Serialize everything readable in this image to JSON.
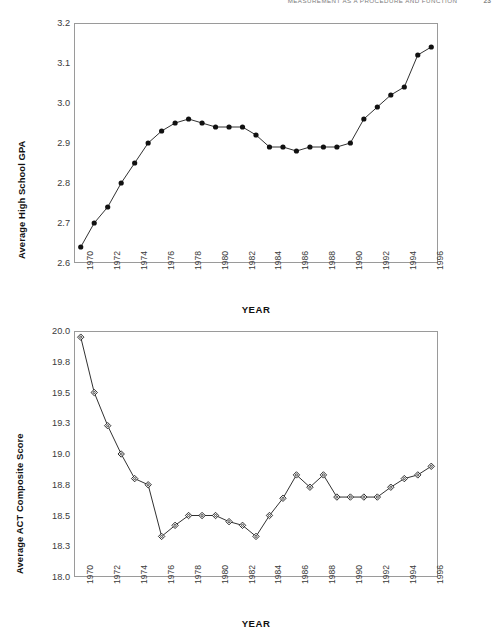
{
  "running_head": {
    "title": "MEASUREMENT AS A PROCEDURE AND FUNCTION",
    "page": "23"
  },
  "figures": [
    {
      "id": "gpa",
      "ylabel": "Average High School GPA",
      "xlabel": "YEAR"
    },
    {
      "id": "act",
      "ylabel": "Average ACT Composite Score",
      "xlabel": "YEAR"
    }
  ],
  "chart_data": [
    {
      "type": "line",
      "title": "",
      "xlabel": "YEAR",
      "ylabel": "Average High School GPA",
      "xlim": [
        1969.5,
        1996.5
      ],
      "ylim": [
        2.6,
        3.2
      ],
      "ytick_labels": [
        "2.6",
        "2.7",
        "2.8",
        "2.9",
        "3.0",
        "3.1",
        "3.2"
      ],
      "ytick_values": [
        2.6,
        2.7,
        2.8,
        2.9,
        3.0,
        3.1,
        3.2
      ],
      "xtick_labels": [
        "1970",
        "1972",
        "1974",
        "1976",
        "1978",
        "1980",
        "1982",
        "1984",
        "1986",
        "1988",
        "1990",
        "1992",
        "1994",
        "1996"
      ],
      "xtick_values": [
        1970,
        1972,
        1974,
        1976,
        1978,
        1980,
        1982,
        1984,
        1986,
        1988,
        1990,
        1992,
        1994,
        1996
      ],
      "grid": false,
      "legend": "none",
      "marker": "filled-circle",
      "x": [
        1970,
        1971,
        1972,
        1973,
        1974,
        1975,
        1976,
        1977,
        1978,
        1979,
        1980,
        1981,
        1982,
        1983,
        1984,
        1985,
        1986,
        1987,
        1988,
        1989,
        1990,
        1991,
        1992,
        1993,
        1994,
        1995,
        1996
      ],
      "values": [
        2.64,
        2.7,
        2.74,
        2.8,
        2.85,
        2.9,
        2.93,
        2.95,
        2.96,
        2.95,
        2.94,
        2.94,
        2.94,
        2.92,
        2.89,
        2.89,
        2.88,
        2.89,
        2.89,
        2.89,
        2.9,
        2.96,
        2.99,
        3.02,
        3.04,
        3.12,
        3.14
      ]
    },
    {
      "type": "line",
      "title": "",
      "xlabel": "YEAR",
      "ylabel": "Average ACT Composite Score",
      "xlim": [
        1969.5,
        1996.5
      ],
      "ylim": [
        18.0,
        20.0
      ],
      "ytick_labels": [
        "18.0",
        "18.3",
        "18.5",
        "18.8",
        "19.0",
        "19.3",
        "19.5",
        "19.8",
        "20.0"
      ],
      "ytick_values": [
        18.0,
        18.25,
        18.5,
        18.75,
        19.0,
        19.25,
        19.5,
        19.75,
        20.0
      ],
      "xtick_labels": [
        "1970",
        "1972",
        "1974",
        "1976",
        "1978",
        "1980",
        "1982",
        "1984",
        "1986",
        "1988",
        "1990",
        "1992",
        "1994",
        "1996"
      ],
      "xtick_values": [
        1970,
        1972,
        1974,
        1976,
        1978,
        1980,
        1982,
        1984,
        1986,
        1988,
        1990,
        1992,
        1994,
        1996
      ],
      "grid": false,
      "legend": "none",
      "marker": "open-diamond",
      "x": [
        1970,
        1971,
        1972,
        1973,
        1974,
        1975,
        1976,
        1977,
        1978,
        1979,
        1980,
        1981,
        1982,
        1983,
        1984,
        1985,
        1986,
        1987,
        1988,
        1989,
        1990,
        1991,
        1992,
        1993,
        1994,
        1995,
        1996
      ],
      "values": [
        19.95,
        19.5,
        19.23,
        19.0,
        18.8,
        18.75,
        18.33,
        18.42,
        18.5,
        18.5,
        18.5,
        18.45,
        18.42,
        18.33,
        18.5,
        18.64,
        18.83,
        18.73,
        18.83,
        18.65,
        18.65,
        18.65,
        18.65,
        18.73,
        18.8,
        18.83,
        18.9
      ]
    }
  ],
  "colors": {
    "line": "#1a1a1a",
    "marker_fill_top": "#111111",
    "marker_fill_bottom": "#ffffff",
    "frame": "#9a9a9a",
    "tick_text": "#3a3a3a",
    "label_text": "#111111"
  }
}
